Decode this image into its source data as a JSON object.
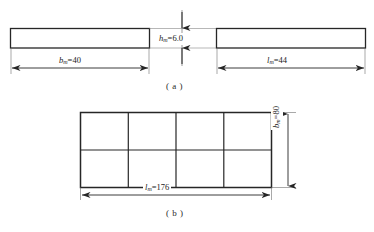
{
  "figure": {
    "kind": "engineering-dimension-drawing",
    "stroke_color": "#262626",
    "thin_stroke_color": "#4a4a4a",
    "background": "#ffffff",
    "subfigures": [
      {
        "id": "a",
        "caption": "( a )",
        "description": "Two elevation views of a rectangular bar with thickness, width and length dimensions",
        "shapes": [
          {
            "name": "left-bar",
            "x": 10,
            "y": 28,
            "width": 140,
            "height": 20
          },
          {
            "name": "right-bar",
            "x": 216,
            "y": 28,
            "width": 150,
            "height": 20
          }
        ],
        "dimensions": [
          {
            "name": "thickness",
            "symbol": "h",
            "subscript": "m",
            "value": "6.0",
            "label": "h_m=6.0",
            "orientation": "vertical"
          },
          {
            "name": "width",
            "symbol": "b",
            "subscript": "m",
            "value": "40",
            "label": "b_m=40",
            "orientation": "horizontal"
          },
          {
            "name": "length",
            "symbol": "l",
            "subscript": "m",
            "value": "44",
            "label": "l_m=44",
            "orientation": "horizontal"
          }
        ]
      },
      {
        "id": "b",
        "caption": "( b )",
        "description": "Plan view of a plate divided into a 4 by 2 grid of panels",
        "grid": {
          "columns": 4,
          "rows": 2,
          "x": 80,
          "y": 112,
          "width": 192,
          "height": 76
        },
        "dimensions": [
          {
            "name": "width",
            "symbol": "b",
            "subscript": "m",
            "value": "80",
            "label": "b_m=80",
            "orientation": "vertical"
          },
          {
            "name": "length",
            "symbol": "l",
            "subscript": "m",
            "value": "176",
            "label": "l_m=176",
            "orientation": "horizontal"
          }
        ]
      }
    ]
  },
  "labels": {
    "h_m": {
      "symbol": "h",
      "sub": "m",
      "eq": "=6.0"
    },
    "b_m_a": {
      "symbol": "b",
      "sub": "m",
      "eq": "=40"
    },
    "l_m_a": {
      "symbol": "l",
      "sub": "m",
      "eq": "=44"
    },
    "b_m_b": {
      "symbol": "b",
      "sub": "m",
      "eq": "=80"
    },
    "l_m_b": {
      "symbol": "l",
      "sub": "m",
      "eq": "=176"
    }
  },
  "captions": {
    "a": "( a )",
    "b": "( b )"
  }
}
